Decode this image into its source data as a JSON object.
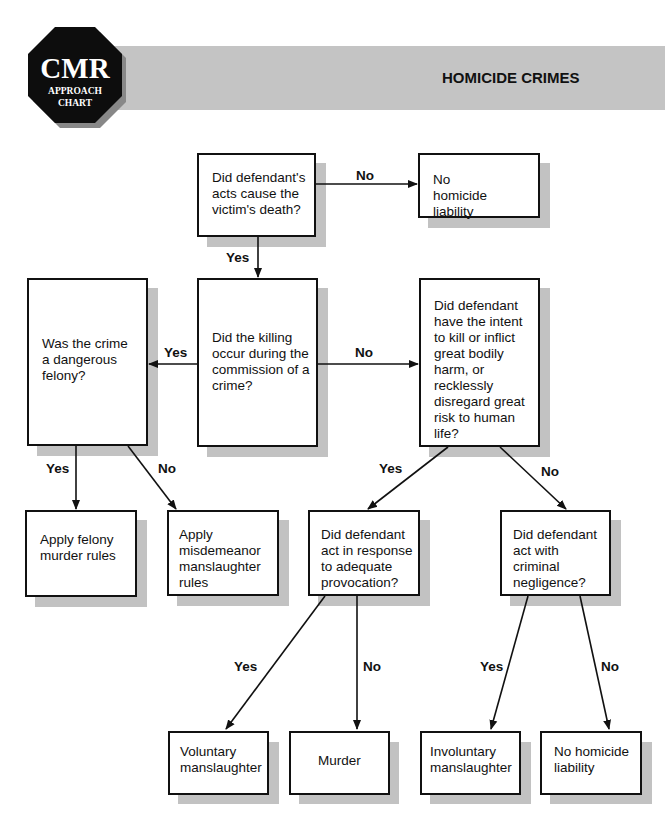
{
  "header": {
    "logo": {
      "main": "CMR",
      "line1": "APPROACH",
      "line2": "CHART"
    },
    "title": "HOMICIDE CRIMES",
    "banner_color": "#c4c4c4"
  },
  "nodes": {
    "causation": "Did defendant's acts cause the victim's death?",
    "no_liability_top": "No homicide liability",
    "dangerous_felony": "Was the crime a dangerous felony?",
    "during_crime": "Did the killing occur during the commission of a crime?",
    "intent": "Did defendant have the intent to kill or inflict great bodily harm, or recklessly disregard great risk to human life?",
    "felony_murder": "Apply felony murder rules",
    "misdemeanor_manslaughter": "Apply misdemeanor manslaughter rules",
    "provocation": "Did defendant act in response to adequate provocation?",
    "negligence": "Did defendant act with criminal negligence?",
    "voluntary": "Voluntary manslaughter",
    "murder": "Murder",
    "involuntary": "Involuntary manslaughter",
    "no_liability_bottom": "No homicide liability"
  },
  "edges": {
    "causation_no": "No",
    "causation_yes": "Yes",
    "crime_yes": "Yes",
    "crime_no": "No",
    "felony_yes": "Yes",
    "felony_no": "No",
    "intent_yes": "Yes",
    "intent_no": "No",
    "provocation_yes": "Yes",
    "provocation_no": "No",
    "negligence_yes": "Yes",
    "negligence_no": "No"
  }
}
